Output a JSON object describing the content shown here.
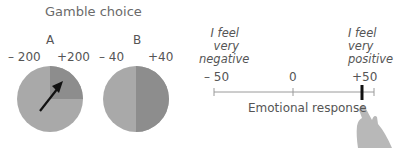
{
  "gamble": {
    "title": "Gamble choice",
    "option_a": {
      "label": "A",
      "loss": "– 200",
      "gain": "+200",
      "gain_fraction": 0.25
    },
    "option_b": {
      "label": "B",
      "loss": "– 40",
      "gain": "+40",
      "gain_fraction": 0.5
    }
  },
  "rating": {
    "left_anchor": [
      "I feel",
      "very",
      "negative"
    ],
    "right_anchor": [
      "I feel",
      "very",
      "positive"
    ],
    "ticks": [
      "– 50",
      "0",
      "+50"
    ],
    "axis_label": "Emotional response",
    "selected_value": "+50"
  },
  "colors": {
    "pie_light": "#a9a9a9",
    "pie_dark": "#8c8c8c",
    "axis": "#9a9a9a",
    "marker": "#111111",
    "hand": "#b5b5b5"
  }
}
